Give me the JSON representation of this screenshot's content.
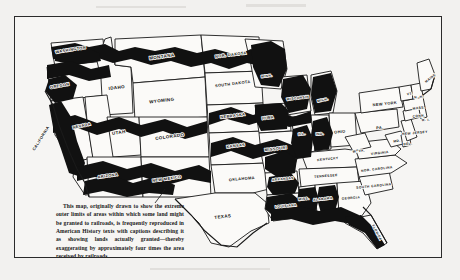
{
  "figure": {
    "kind": "historical-map",
    "background_color": "#f2f1ef",
    "paper_color": "#f6f5f3",
    "ink_color": "#111111",
    "border_color": "#2b2b2b"
  },
  "top_ghost_text": "",
  "caption": {
    "text": "This map, originally drawn to show the extreme outer limits of areas within which some land might be granted to railroads, is frequently reproduced in American History texts with captions describing it as showing lands actually granted—thereby exaggerating by approximately four times the area received by railroads."
  },
  "legend": {
    "shaded_meaning": "extreme outer limits of areas within which some land might be granted to railroads",
    "unshaded_meaning": "area outside land grant limits"
  },
  "states": [
    {
      "name": "WASHINGTON",
      "label": "WASHINGTON",
      "size": "sz7",
      "x": 56,
      "y": 34,
      "rot": -9,
      "shaded": true
    },
    {
      "name": "OREGON",
      "label": "OREGON",
      "size": "sz7",
      "x": 45,
      "y": 70,
      "rot": -10,
      "shaded": true
    },
    {
      "name": "CALIFORNIA",
      "label": "CALIFORNIA",
      "size": "sz7",
      "x": 27,
      "y": 122,
      "rot": -58,
      "shaded": true
    },
    {
      "name": "NEVADA",
      "label": "NEVADA",
      "size": "sz7",
      "x": 67,
      "y": 110,
      "rot": -12,
      "shaded": true
    },
    {
      "name": "IDAHO",
      "label": "IDAHO",
      "size": "sz8",
      "x": 102,
      "y": 72,
      "rot": -7,
      "shaded": true
    },
    {
      "name": "MONTANA",
      "label": "MONTANA",
      "size": "sz8",
      "x": 147,
      "y": 41,
      "rot": -8,
      "shaded": true
    },
    {
      "name": "WYOMING",
      "label": "WYOMING",
      "size": "sz8",
      "x": 147,
      "y": 85,
      "rot": -7,
      "shaded": true
    },
    {
      "name": "UTAH",
      "label": "UTAH",
      "size": "sz8",
      "x": 104,
      "y": 117,
      "rot": -8,
      "shaded": true
    },
    {
      "name": "COLORADO",
      "label": "COLORADO",
      "size": "sz8",
      "x": 155,
      "y": 121,
      "rot": -8,
      "shaded": true
    },
    {
      "name": "ARIZONA",
      "label": "ARIZONA",
      "size": "sz7",
      "x": 93,
      "y": 160,
      "rot": -8,
      "shaded": true
    },
    {
      "name": "NEW MEXICO",
      "label": "NEW MEXICO",
      "size": "sz7",
      "x": 152,
      "y": 163,
      "rot": -8,
      "shaded": true
    },
    {
      "name": "NORTH DAKOTA",
      "label": "NOR. DAKOTA",
      "size": "sz7",
      "x": 216,
      "y": 39,
      "rot": -7,
      "shaded": true
    },
    {
      "name": "SOUTH DAKOTA",
      "label": "SOUTH DAKOTA",
      "size": "sz7",
      "x": 218,
      "y": 68,
      "rot": -7,
      "shaded": true
    },
    {
      "name": "NEBRASKA",
      "label": "NEBRASKA",
      "size": "sz7",
      "x": 218,
      "y": 100,
      "rot": -7,
      "shaded": true
    },
    {
      "name": "KANSAS",
      "label": "KANSAS",
      "size": "sz7",
      "x": 221,
      "y": 130,
      "rot": -7,
      "shaded": true
    },
    {
      "name": "OKLAHOMA",
      "label": "OKLAHOMA",
      "size": "sz7",
      "x": 227,
      "y": 163,
      "rot": -5,
      "shaded": false
    },
    {
      "name": "TEXAS",
      "label": "TEXAS",
      "size": "sz8",
      "x": 208,
      "y": 201,
      "rot": -6,
      "shaded": false
    },
    {
      "name": "MINNESOTA",
      "label": "MINN.",
      "size": "sz6",
      "x": 252,
      "y": 60,
      "rot": -7,
      "shaded": true
    },
    {
      "name": "IOWA",
      "label": "IOWA",
      "size": "sz7",
      "x": 253,
      "y": 102,
      "rot": -6,
      "shaded": true
    },
    {
      "name": "MISSOURI",
      "label": "MISSOURI",
      "size": "sz7",
      "x": 261,
      "y": 133,
      "rot": -7,
      "shaded": true
    },
    {
      "name": "ARKANSAS",
      "label": "ARKANSAS",
      "size": "sz6",
      "x": 268,
      "y": 163,
      "rot": -6,
      "shaded": true
    },
    {
      "name": "LOUISIANA",
      "label": "LOUISIANA",
      "size": "sz6",
      "x": 271,
      "y": 190,
      "rot": -5,
      "shaded": true
    },
    {
      "name": "WISCONSIN",
      "label": "WISCONSIN",
      "size": "sz6",
      "x": 283,
      "y": 82,
      "rot": -7,
      "shaded": true
    },
    {
      "name": "MICHIGAN",
      "label": "MICH.",
      "size": "sz6",
      "x": 308,
      "y": 84,
      "rot": -12,
      "shaded": true
    },
    {
      "name": "ILLINOIS",
      "label": "ILL.",
      "size": "sz6",
      "x": 287,
      "y": 118,
      "rot": -6,
      "shaded": true
    },
    {
      "name": "INDIANA",
      "label": "IND.",
      "size": "sz6",
      "x": 305,
      "y": 118,
      "rot": -5,
      "shaded": true
    },
    {
      "name": "OHIO",
      "label": "OHIO",
      "size": "sz7",
      "x": 325,
      "y": 116,
      "rot": -4,
      "shaded": false
    },
    {
      "name": "KENTUCKY",
      "label": "KENTUCKY",
      "size": "sz6",
      "x": 313,
      "y": 143,
      "rot": -6,
      "shaded": false
    },
    {
      "name": "TENNESSEE",
      "label": "TENNESSEE",
      "size": "sz6",
      "x": 311,
      "y": 160,
      "rot": -5,
      "shaded": false
    },
    {
      "name": "MISSISSIPPI",
      "label": "MISS.",
      "size": "sz6",
      "x": 289,
      "y": 183,
      "rot": -6,
      "shaded": true
    },
    {
      "name": "ALABAMA",
      "label": "ALABAMA",
      "size": "sz6",
      "x": 308,
      "y": 183,
      "rot": -6,
      "shaded": true
    },
    {
      "name": "GEORGIA",
      "label": "GEORGIA",
      "size": "sz6",
      "x": 336,
      "y": 182,
      "rot": -4,
      "shaded": false
    },
    {
      "name": "FLORIDA",
      "label": "FLORIDA",
      "size": "sz6",
      "x": 361,
      "y": 216,
      "rot": 62,
      "shaded": true
    },
    {
      "name": "SOUTH CAROLINA",
      "label": "SOUTH CAROLINA",
      "size": "sz6",
      "x": 359,
      "y": 170,
      "rot": -6,
      "shaded": false
    },
    {
      "name": "NORTH CAROLINA",
      "label": "NOR. CAROLINA",
      "size": "sz6",
      "x": 362,
      "y": 153,
      "rot": -7,
      "shaded": false
    },
    {
      "name": "VIRGINIA",
      "label": "VIRGINIA",
      "size": "sz6",
      "x": 365,
      "y": 137,
      "rot": -6,
      "shaded": false
    },
    {
      "name": "WEST VIRGINIA",
      "label": "W. VA.",
      "size": "sz6",
      "x": 344,
      "y": 135,
      "rot": -6,
      "shaded": false
    },
    {
      "name": "PENNSYLVANIA",
      "label": "PA.",
      "size": "sz7",
      "x": 365,
      "y": 112,
      "rot": -4,
      "shaded": false
    },
    {
      "name": "NEW YORK",
      "label": "NEW YORK",
      "size": "sz7",
      "x": 370,
      "y": 88,
      "rot": -6,
      "shaded": false
    },
    {
      "name": "MARYLAND",
      "label": "MD.",
      "size": "sz6",
      "x": 382,
      "y": 125,
      "rot": -6,
      "shaded": false
    },
    {
      "name": "DELAWARE",
      "label": "DEL.",
      "size": "sz6",
      "x": 393,
      "y": 128,
      "rot": -4,
      "shaded": false
    },
    {
      "name": "NEW JERSEY",
      "label": "NEW JERSEY",
      "size": "sz6",
      "x": 400,
      "y": 117,
      "rot": -5,
      "shaded": false
    },
    {
      "name": "CONNECTICUT",
      "label": "CONN.",
      "size": "sz6",
      "x": 404,
      "y": 100,
      "rot": -6,
      "shaded": false
    },
    {
      "name": "RHODE ISLAND",
      "label": "R. I.",
      "size": "sz6",
      "x": 411,
      "y": 104,
      "rot": -4,
      "shaded": false
    },
    {
      "name": "MASSACHUSETTS",
      "label": "MASS.",
      "size": "sz6",
      "x": 404,
      "y": 92,
      "rot": -6,
      "shaded": false
    },
    {
      "name": "VERMONT",
      "label": "VT.",
      "size": "sz6",
      "x": 395,
      "y": 78,
      "rot": -6,
      "shaded": false
    },
    {
      "name": "NEW HAMPSHIRE",
      "label": "N. H.",
      "size": "sz6",
      "x": 404,
      "y": 81,
      "rot": -6,
      "shaded": false
    },
    {
      "name": "MAINE",
      "label": "MAINE",
      "size": "sz6",
      "x": 416,
      "y": 62,
      "rot": -38,
      "shaded": false
    }
  ]
}
